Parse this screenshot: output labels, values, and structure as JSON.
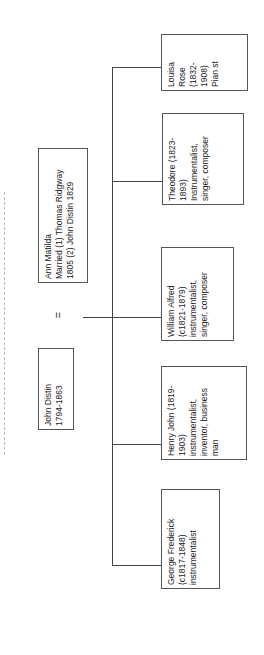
{
  "parents": {
    "father": {
      "lines": [
        "John Distin",
        "1794-1863"
      ]
    },
    "mother": {
      "lines": [
        "Ann Matilda",
        "Married (1) Thomas Ridgway",
        "1805 (2) John Distin 1829"
      ]
    },
    "marriage_symbol": "="
  },
  "children": [
    {
      "lines": [
        "Louisa",
        "Rose",
        "(1832-",
        "1908)",
        "Pian st"
      ]
    },
    {
      "lines": [
        "Theodore (1823-",
        "1893)",
        "Instrumentalist,",
        "singer, composer"
      ]
    },
    {
      "lines": [
        "William Alfred",
        "(c1821-1879)",
        "instrumentalist,",
        "singer, composer"
      ]
    },
    {
      "lines": [
        "Henry John (1819-",
        "1903)",
        "instrumentalist,",
        "inventor, business",
        "man"
      ]
    },
    {
      "lines": [
        "George Frederick",
        "(c1817-1848)",
        "instrumentalist"
      ]
    }
  ]
}
